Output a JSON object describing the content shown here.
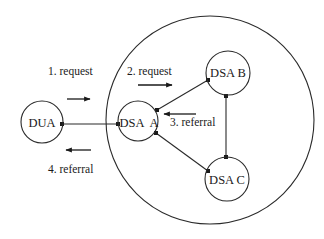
{
  "diagram": {
    "domain_boundary": {
      "cx": 210,
      "cy": 120,
      "r": 104
    },
    "nodes": [
      {
        "id": "dua",
        "label": "DUA",
        "cx": 42,
        "cy": 122,
        "r": 21
      },
      {
        "id": "dsa_a",
        "label": "DSA  A",
        "cx": 138,
        "cy": 121,
        "r": 20
      },
      {
        "id": "dsa_b",
        "label": "DSA B",
        "cx": 228,
        "cy": 73,
        "r": 22
      },
      {
        "id": "dsa_c",
        "label": "DSA C",
        "cx": 227,
        "cy": 179,
        "r": 22
      }
    ],
    "connections": [
      {
        "from": "dua",
        "to": "dsa_a"
      },
      {
        "from": "dsa_a",
        "to": "dsa_b"
      },
      {
        "from": "dsa_a",
        "to": "dsa_c"
      },
      {
        "from": "dsa_b",
        "to": "dsa_c"
      }
    ],
    "steps": [
      {
        "label": "1. request",
        "direction": "right"
      },
      {
        "label": "2. request",
        "direction": "right"
      },
      {
        "label": "3. referral",
        "direction": "left"
      },
      {
        "label": "4. referral",
        "direction": "left"
      }
    ],
    "colors": {
      "line": "#2a2a2a",
      "text": "#1a1a1a",
      "background": "#ffffff"
    }
  }
}
